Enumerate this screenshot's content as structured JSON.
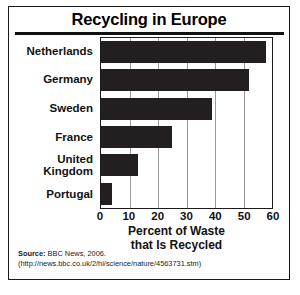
{
  "chart_data": {
    "type": "bar",
    "orientation": "horizontal",
    "title": "Recycling in Europe",
    "categories": [
      "Netherlands",
      "Germany",
      "Sweden",
      "France",
      "United Kingdom",
      "Portugal"
    ],
    "category_lines": [
      [
        "Netherlands"
      ],
      [
        "Germany"
      ],
      [
        "Sweden"
      ],
      [
        "France"
      ],
      [
        "United",
        "Kingdom"
      ],
      [
        "Portugal"
      ]
    ],
    "values": [
      58,
      52,
      39,
      25,
      13,
      4
    ],
    "xlabel": "Percent of Waste that Is Recycled",
    "xlabel_lines": [
      "Percent of Waste",
      "that Is Recycled"
    ],
    "ylabel": "",
    "xlim": [
      0,
      60
    ],
    "xticks": [
      0,
      10,
      20,
      30,
      40,
      50,
      60
    ],
    "grid": "vertical",
    "legend": "none",
    "bar_color": "#231f20",
    "grid_color": "#9a9a9a",
    "frame_color": "#1a1a1a"
  },
  "source": {
    "label": "Source:",
    "text": "BBC News, 2006.",
    "url": "(http://news.bbc.co.uk/2/hi/science/nature/4563731.stm)"
  }
}
